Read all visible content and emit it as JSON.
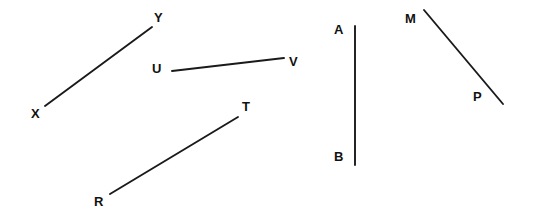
{
  "figure": {
    "width": 533,
    "height": 223,
    "background_color": "#ffffff",
    "stroke_color": "#1a1a1a",
    "label_color": "#111111"
  },
  "diagram": {
    "type": "line-segments",
    "segments": [
      {
        "id": "XY",
        "name": "segment-xy",
        "x1": 45,
        "y1": 106,
        "x2": 152,
        "y2": 27,
        "endpoints": [
          {
            "label": "X",
            "label_x": 31,
            "label_y": 107
          },
          {
            "label": "Y",
            "label_x": 154,
            "label_y": 11
          }
        ]
      },
      {
        "id": "UV",
        "name": "segment-uv",
        "x1": 172,
        "y1": 71,
        "x2": 284,
        "y2": 58,
        "endpoints": [
          {
            "label": "U",
            "label_x": 152,
            "label_y": 62
          },
          {
            "label": "V",
            "label_x": 289,
            "label_y": 55
          }
        ]
      },
      {
        "id": "RT",
        "name": "segment-rt",
        "x1": 110,
        "y1": 194,
        "x2": 238,
        "y2": 117,
        "endpoints": [
          {
            "label": "R",
            "label_x": 94,
            "label_y": 195
          },
          {
            "label": "T",
            "label_x": 242,
            "label_y": 100
          }
        ]
      },
      {
        "id": "AB",
        "name": "segment-ab",
        "x1": 355,
        "y1": 26,
        "x2": 355,
        "y2": 165,
        "endpoints": [
          {
            "label": "A",
            "label_x": 334,
            "label_y": 23
          },
          {
            "label": "B",
            "label_x": 334,
            "label_y": 150
          }
        ]
      },
      {
        "id": "MP",
        "name": "segment-mp",
        "x1": 424,
        "y1": 10,
        "x2": 503,
        "y2": 104,
        "endpoints": [
          {
            "label": "M",
            "label_x": 405,
            "label_y": 12
          },
          {
            "label": "P",
            "label_x": 473,
            "label_y": 90
          }
        ]
      }
    ]
  }
}
